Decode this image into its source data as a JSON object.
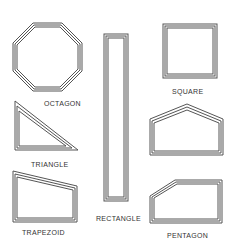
{
  "labels": {
    "octagon": "OCTAGON",
    "square": "SQUARE",
    "triangle": "TRIANGLE",
    "rectangle": "RECTANGLE",
    "trapezoid": "TRAPEZOID",
    "pentagon": "PENTAGON"
  },
  "colors": {
    "stroke": "#555555",
    "text": "#333333",
    "background": "#ffffff"
  }
}
